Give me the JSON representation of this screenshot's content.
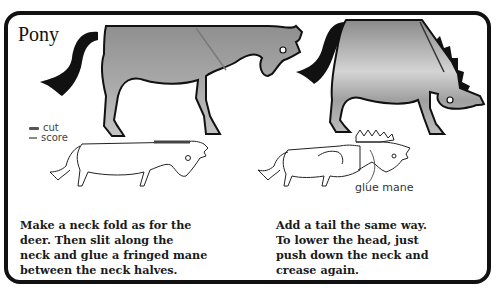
{
  "page": {
    "title": "Pony",
    "legend": {
      "items": [
        {
          "label": "cut",
          "color": "#555555"
        },
        {
          "label": "score",
          "color": "#888888"
        }
      ]
    },
    "diagram_label": "glue mane",
    "instructions": {
      "left": [
        "Make a neck fold as for the",
        "deer. Then slit along the",
        "neck and glue a fringed mane",
        "between the neck halves."
      ],
      "right": [
        "Add a tail the same way.",
        "To lower the head, just",
        "push down the neck and",
        "crease again."
      ]
    },
    "colors": {
      "outline": "#111111",
      "body_fill": "#9a9a9a",
      "body_light": "#c8c8c8"
    }
  }
}
